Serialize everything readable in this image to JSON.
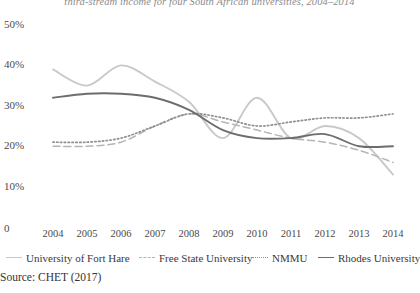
{
  "chart_data": {
    "type": "line",
    "title": "third-stream income for four South African universities, 2004–2014",
    "xlabel": "",
    "ylabel": "",
    "x": [
      2004,
      2005,
      2006,
      2007,
      2008,
      2009,
      2010,
      2011,
      2012,
      2013,
      2014
    ],
    "xticklabels": [
      "2004",
      "2005",
      "2006",
      "2007",
      "2008",
      "2009",
      "2010",
      "2011",
      "2012",
      "2013",
      "2014"
    ],
    "yticklabels": [
      "0",
      "10%",
      "20%",
      "30%",
      "40%",
      "50%"
    ],
    "yticks": [
      0,
      10,
      20,
      30,
      40,
      50
    ],
    "ylim": [
      0,
      50
    ],
    "grid": false,
    "legend_position": "bottom",
    "series": [
      {
        "name": "University of Fort Hare",
        "style": "solid",
        "color": "#c9c9c9",
        "values": [
          39,
          35,
          40,
          36,
          31,
          22,
          32,
          22,
          25,
          22,
          13
        ]
      },
      {
        "name": "Free State University",
        "style": "dashed",
        "color": "#b5b5b5",
        "values": [
          20,
          20,
          21,
          25,
          28,
          26,
          24,
          22,
          21,
          19,
          16
        ]
      },
      {
        "name": "NMMU",
        "style": "dotted",
        "color": "#8f8f8f",
        "values": [
          21,
          21,
          22,
          25,
          28,
          27,
          25,
          26,
          27,
          27,
          28
        ]
      },
      {
        "name": "Rhodes University",
        "style": "solid",
        "color": "#6d6d6d",
        "values": [
          32,
          33,
          33,
          32,
          29,
          24,
          22,
          22,
          23,
          20,
          20
        ]
      }
    ]
  },
  "source": {
    "text": "Source: CHET (2017)"
  }
}
